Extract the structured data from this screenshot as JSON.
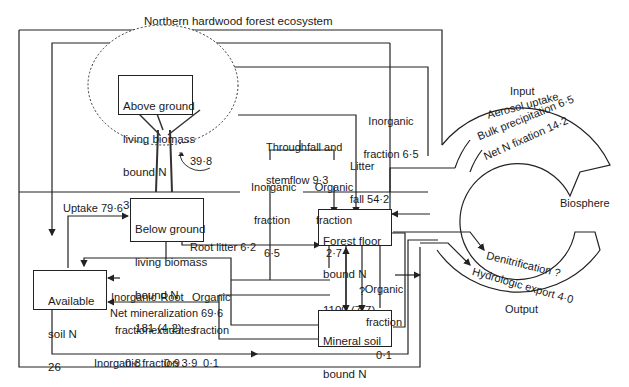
{
  "title": "Northern hardwood forest ecosystem",
  "compartments": {
    "above_ground": {
      "line1": "Above ground",
      "line2": "living biomass",
      "line3": "bound N",
      "value": "351 (4·8)"
    },
    "below_ground": {
      "line1": "Below ground",
      "line2": "living biomass",
      "line3": "bound N",
      "value": "181 (4·2)"
    },
    "forest_floor": {
      "line1": "Forest floor",
      "line2": "bound N",
      "value": "1100 (7·7)"
    },
    "mineral_soil": {
      "line1": "Mineral soil",
      "line2": "bound N",
      "value": "3600 (?)"
    },
    "available_soil": {
      "line1": "Available",
      "line2": "soil N",
      "value": "26"
    }
  },
  "flows": {
    "internal_cycle": "39·8",
    "throughfall": {
      "line1": "Throughfall and",
      "line2": "stemflow 9·3"
    },
    "tf_inorganic": {
      "line1": "Inorganic",
      "line2": "fraction",
      "value": "6·5"
    },
    "tf_organic": {
      "line1": "Organic",
      "line2": "fraction",
      "value": "2·7"
    },
    "litter_fall": {
      "line1": "Litter",
      "line2": "fall 54·2"
    },
    "inorganic_top": {
      "line1": "Inorganic",
      "line2": "fraction 6·5"
    },
    "uptake": "Uptake 79·6",
    "root_litter": "Root litter 6·2",
    "exud_inorganic": {
      "line1": "Inorganic",
      "line2": "fraction",
      "value": "0·8"
    },
    "root_exudates": {
      "line1": "Root",
      "line2": "exudates",
      "value": "0·9"
    },
    "exud_organic": {
      "line1": "Organic",
      "line2": "fraction",
      "value": "0·1"
    },
    "net_mineralization": "Net mineralization 69·6",
    "ff_organic": {
      "line1": "Organic",
      "line2": "fraction",
      "value": "0·1"
    },
    "unknown": "?",
    "inorganic_bottom": "Inorganic fraction 3·9"
  },
  "biosphere": {
    "label": "Biosphere",
    "input_label": "Input",
    "output_label": "Output",
    "inputs": [
      "Aerosol uptake",
      "Bulk precipitation 6·5",
      "Net N fixation 14·2"
    ],
    "outputs": [
      "Denitrification ?",
      "Hydrologic export 4·0"
    ]
  }
}
